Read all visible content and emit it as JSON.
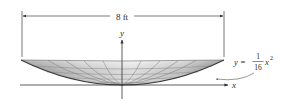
{
  "figure": {
    "dimension_label": "8 ft",
    "x_axis_label": "x",
    "y_axis_label": "y",
    "equation": {
      "lhs": "y =",
      "numerator": "1",
      "denominator": "16",
      "variable": "x",
      "exponent": "2"
    },
    "colors": {
      "line": "#333333",
      "surface_light": "#f2f2f2",
      "surface_dark": "#9a9a9a",
      "mesh": "#7a7a7a"
    }
  }
}
